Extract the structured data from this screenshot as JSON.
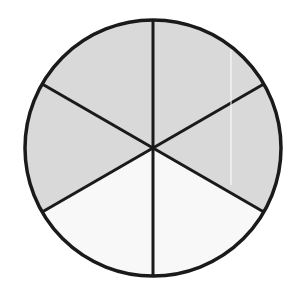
{
  "diagram": {
    "type": "fraction-circle",
    "total_parts": 6,
    "shaded_parts": 4,
    "fraction": "4/6",
    "center": [
      153,
      148
    ],
    "radius": 128,
    "colors": {
      "shaded": "#d9d9d9",
      "unshaded": "#f8f8f8",
      "stroke": "#1a1a1a"
    },
    "sectors": [
      {
        "start_deg": 90,
        "end_deg": 30,
        "shaded": true
      },
      {
        "start_deg": 30,
        "end_deg": -30,
        "shaded": true
      },
      {
        "start_deg": -30,
        "end_deg": -90,
        "shaded": false
      },
      {
        "start_deg": -90,
        "end_deg": -150,
        "shaded": false
      },
      {
        "start_deg": -150,
        "end_deg": -210,
        "shaded": true
      },
      {
        "start_deg": 150,
        "end_deg": 90,
        "shaded": true
      }
    ]
  }
}
